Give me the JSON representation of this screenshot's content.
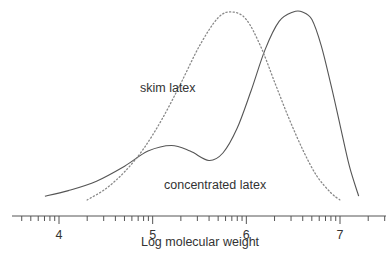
{
  "chart_data": {
    "type": "line",
    "title": "",
    "xlabel": "Log molecular weight",
    "ylabel": "",
    "xlim": [
      3.55,
      7.55
    ],
    "x_ticks": [
      "4",
      "5",
      "6",
      "7"
    ],
    "grid": false,
    "legend": "inline annotations",
    "annotations": [
      {
        "text": "skim latex",
        "x": 5.45,
        "y": 0.62
      },
      {
        "text": "concentrated latex",
        "x": 5.3,
        "y": 0.18
      }
    ],
    "series": [
      {
        "name": "concentrated latex",
        "style": "solid",
        "x": [
          3.85,
          4.1,
          4.4,
          4.7,
          4.95,
          5.2,
          5.4,
          5.6,
          5.75,
          5.9,
          6.05,
          6.2,
          6.35,
          6.5,
          6.6,
          6.7,
          6.8,
          6.9,
          7.0,
          7.1,
          7.2
        ],
        "y": [
          0.02,
          0.05,
          0.1,
          0.18,
          0.26,
          0.29,
          0.26,
          0.21,
          0.25,
          0.38,
          0.58,
          0.8,
          0.95,
          1.0,
          1.0,
          0.96,
          0.82,
          0.62,
          0.4,
          0.18,
          0.02
        ]
      },
      {
        "name": "skim latex",
        "style": "dotted",
        "x": [
          4.3,
          4.5,
          4.7,
          4.9,
          5.1,
          5.3,
          5.5,
          5.7,
          5.85,
          6.0,
          6.15,
          6.3,
          6.45,
          6.6,
          6.75,
          6.9,
          7.0
        ],
        "y": [
          0.0,
          0.06,
          0.15,
          0.27,
          0.43,
          0.62,
          0.82,
          0.97,
          1.0,
          0.96,
          0.82,
          0.63,
          0.44,
          0.27,
          0.13,
          0.04,
          0.0
        ]
      }
    ]
  }
}
